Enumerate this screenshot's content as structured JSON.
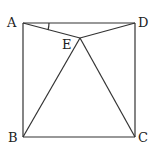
{
  "diagram": {
    "type": "geometry",
    "points": {
      "A": {
        "label": "A",
        "x": 23,
        "y": 23
      },
      "D": {
        "label": "D",
        "x": 135,
        "y": 23
      },
      "B": {
        "label": "B",
        "x": 23,
        "y": 137
      },
      "C": {
        "label": "C",
        "x": 135,
        "y": 137
      },
      "E": {
        "label": "E",
        "x": 80,
        "y": 38
      }
    },
    "segments": [
      "AD",
      "DC",
      "CB",
      "BA",
      "AE",
      "DE",
      "BE",
      "CE"
    ],
    "angle_marks": [
      "DAE"
    ]
  }
}
